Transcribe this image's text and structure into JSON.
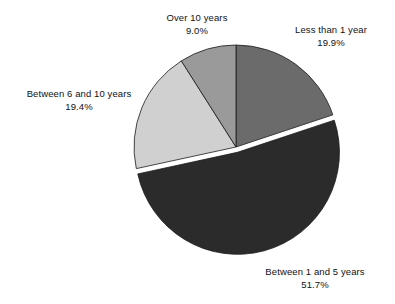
{
  "chart_data": {
    "type": "pie",
    "title": "",
    "subtitle": "",
    "xlabel": "",
    "ylabel": "",
    "legend_position": "none",
    "grid": false,
    "background_color": "#ffffff",
    "start_angle_deg": 0,
    "direction": "clockwise",
    "categories": [
      "Less than 1 year",
      "Between 1 and 5 years",
      "Between 6 and 10 years",
      "Over 10 years"
    ],
    "values": [
      19.9,
      51.7,
      19.4,
      9.0
    ],
    "value_labels": [
      "19.9%",
      "51.7%",
      "19.4%",
      "9.0%"
    ],
    "colors": [
      "#6b6b6b",
      "#2b2b2b",
      "#d0d0d0",
      "#9a9a9a"
    ],
    "exploded": [
      false,
      true,
      false,
      false
    ],
    "slices": [
      {
        "name": "Less than 1 year",
        "value": 19.9,
        "value_label": "19.9%",
        "color": "#6b6b6b",
        "exploded": false
      },
      {
        "name": "Between 1 and 5 years",
        "value": 51.7,
        "value_label": "51.7%",
        "color": "#2b2b2b",
        "exploded": true
      },
      {
        "name": "Between 6 and 10 years",
        "value": 19.4,
        "value_label": "19.4%",
        "color": "#d0d0d0",
        "exploded": false
      },
      {
        "name": "Over 10 years",
        "value": 9.0,
        "value_label": "9.0%",
        "color": "#9a9a9a",
        "exploded": false
      }
    ]
  },
  "labels": {
    "over_10": {
      "name": "Over 10 years",
      "value": "9.0%"
    },
    "less_than_1": {
      "name": "Less than 1 year",
      "value": "19.9%"
    },
    "between_6_10": {
      "name": "Between 6 and 10 years",
      "value": "19.4%"
    },
    "between_1_5": {
      "name": "Between 1 and 5 years",
      "value": "51.7%"
    }
  }
}
